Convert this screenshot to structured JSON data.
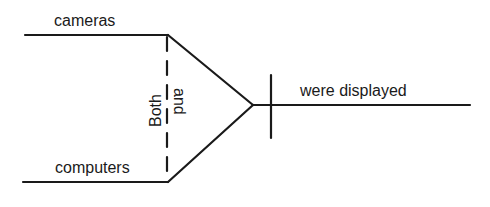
{
  "diagram": {
    "type": "sentence-diagram",
    "subjects": [
      {
        "label": "cameras"
      },
      {
        "label": "computers"
      }
    ],
    "correlative_conjunction": {
      "first": "Both",
      "second": "and"
    },
    "predicate": {
      "label": "were displayed"
    },
    "colors": {
      "line": "#1a1a1a",
      "background": "#ffffff"
    }
  }
}
